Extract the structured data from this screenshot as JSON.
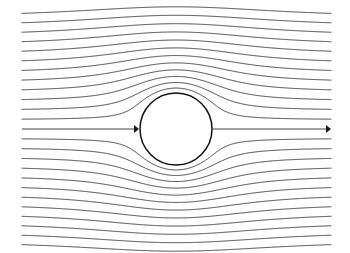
{
  "figure": {
    "kind": "streamline-diagram",
    "width": 350,
    "height": 253,
    "background_color": "#ffffff"
  },
  "cylinder": {
    "name": "circular-cylinder",
    "center_x": 176,
    "center_y": 129,
    "radius": 36,
    "stroke_color": "#101010",
    "stroke_width": 1.5,
    "fill_color": "#ffffff"
  },
  "flow": {
    "direction": "left-to-right",
    "freestream_label": "",
    "stroke_color": "#2b2b2b",
    "stroke_width": 0.85,
    "x_start": 22,
    "x_end": 331,
    "streamline_count": 24,
    "streamline_spacing": 9.3,
    "centerline_y": 129,
    "offsets_upper": [
      9.3,
      18.6,
      27.9,
      37.2,
      46.5,
      55.8,
      65.1,
      74.4,
      83.7,
      93.0,
      102.3,
      111.6
    ],
    "offsets_lower": [
      -9.3,
      -18.6,
      -27.9,
      -37.2,
      -46.5,
      -55.8,
      -65.1,
      -74.4,
      -83.7,
      -93.0,
      -102.3,
      -111.6
    ]
  },
  "arrows": {
    "upstream": {
      "name": "upstream-flow-arrow",
      "x1": 22,
      "x2": 139,
      "y": 129,
      "head_size": 5,
      "color": "#1a1a1a"
    },
    "downstream": {
      "name": "downstream-flow-arrow",
      "x1": 213,
      "x2": 331,
      "y": 129,
      "head_size": 5,
      "color": "#1a1a1a"
    }
  },
  "chart_data": {
    "type": "line",
    "xlabel": "",
    "ylabel": "",
    "xlim": [
      22,
      331
    ],
    "ylim": [
      0,
      253
    ],
    "grid": false,
    "legend": "none",
    "annotations": [
      "upstream arrow on stagnation streamline",
      "downstream arrow on stagnation streamline"
    ],
    "series": [
      {
        "name": "streamline-upper-12",
        "psi_offset": 111.6
      },
      {
        "name": "streamline-upper-11",
        "psi_offset": 102.3
      },
      {
        "name": "streamline-upper-10",
        "psi_offset": 93.0
      },
      {
        "name": "streamline-upper-9",
        "psi_offset": 83.7
      },
      {
        "name": "streamline-upper-8",
        "psi_offset": 74.4
      },
      {
        "name": "streamline-upper-7",
        "psi_offset": 65.1
      },
      {
        "name": "streamline-upper-6",
        "psi_offset": 55.8
      },
      {
        "name": "streamline-upper-5",
        "psi_offset": 46.5
      },
      {
        "name": "streamline-upper-4",
        "psi_offset": 37.2
      },
      {
        "name": "streamline-upper-3",
        "psi_offset": 27.9
      },
      {
        "name": "streamline-upper-2",
        "psi_offset": 18.6
      },
      {
        "name": "streamline-upper-1",
        "psi_offset": 9.3
      },
      {
        "name": "streamline-center",
        "psi_offset": 0
      },
      {
        "name": "streamline-lower-1",
        "psi_offset": -9.3
      },
      {
        "name": "streamline-lower-2",
        "psi_offset": -18.6
      },
      {
        "name": "streamline-lower-3",
        "psi_offset": -27.9
      },
      {
        "name": "streamline-lower-4",
        "psi_offset": -37.2
      },
      {
        "name": "streamline-lower-5",
        "psi_offset": -46.5
      },
      {
        "name": "streamline-lower-6",
        "psi_offset": -55.8
      },
      {
        "name": "streamline-lower-7",
        "psi_offset": -65.1
      },
      {
        "name": "streamline-lower-8",
        "psi_offset": -74.4
      },
      {
        "name": "streamline-lower-9",
        "psi_offset": -83.7
      },
      {
        "name": "streamline-lower-10",
        "psi_offset": -93.0
      },
      {
        "name": "streamline-lower-11",
        "psi_offset": -102.3
      },
      {
        "name": "streamline-lower-12",
        "psi_offset": -111.6
      }
    ]
  }
}
